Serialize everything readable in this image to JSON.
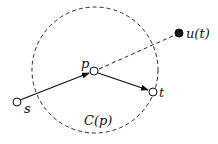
{
  "diagram": {
    "colors": {
      "stroke": "#111111",
      "fill_open": "#ffffff",
      "fill_solid": "#111111",
      "background": "#ffffff"
    },
    "circle": {
      "label": "C(p)",
      "cx": 95,
      "cy": 70,
      "r": 63,
      "style": "dashed"
    },
    "nodes": [
      {
        "id": "s",
        "label": "s",
        "x": 17,
        "y": 102,
        "style": "open"
      },
      {
        "id": "p",
        "label": "p",
        "x": 94,
        "y": 71,
        "style": "open"
      },
      {
        "id": "t",
        "label": "t",
        "x": 153,
        "y": 92,
        "style": "open"
      },
      {
        "id": "u",
        "label": "u(t)",
        "x": 179,
        "y": 33,
        "style": "filled"
      }
    ],
    "edges": [
      {
        "from": "s",
        "to": "p",
        "style": "solid-arrow"
      },
      {
        "from": "p",
        "to": "t",
        "style": "solid-arrow"
      },
      {
        "from": "p",
        "to": "u",
        "style": "dashed"
      }
    ]
  }
}
